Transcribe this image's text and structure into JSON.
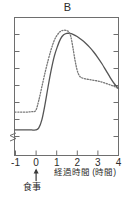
{
  "chart_data": {
    "type": "line",
    "title": "B",
    "xlabel": "経過時間 (時間)",
    "ylabel": "",
    "xlim": [
      -1,
      4
    ],
    "ylim": [
      0,
      1
    ],
    "grid": false,
    "legend": "none",
    "xticks": [
      "-1",
      "0",
      "1",
      "2",
      "3",
      "4"
    ],
    "xtick_values": [
      -1,
      0,
      1,
      2,
      3,
      4
    ],
    "ytick_count": 8,
    "yticks": [],
    "y_axis_break": true,
    "annotations": [
      {
        "name": "meal-marker",
        "text": "食事",
        "x": 0,
        "arrow": "up"
      }
    ],
    "series": [
      {
        "name": "solid-curve",
        "style": "solid",
        "color": "#555555",
        "x": [
          -1.0,
          -0.8,
          -0.6,
          -0.4,
          -0.2,
          0.0,
          0.15,
          0.3,
          0.45,
          0.6,
          0.75,
          0.9,
          1.05,
          1.2,
          1.35,
          1.5,
          1.65,
          1.8,
          2.0,
          2.2,
          2.4,
          2.6,
          2.8,
          3.0,
          3.2,
          3.4,
          3.6,
          3.8,
          4.0
        ],
        "y": [
          0.185,
          0.185,
          0.185,
          0.185,
          0.185,
          0.185,
          0.2,
          0.26,
          0.37,
          0.5,
          0.62,
          0.72,
          0.79,
          0.845,
          0.875,
          0.885,
          0.885,
          0.878,
          0.862,
          0.84,
          0.815,
          0.785,
          0.75,
          0.71,
          0.665,
          0.615,
          0.565,
          0.52,
          0.485
        ]
      },
      {
        "name": "dotted-curve",
        "style": "dotted",
        "color": "#777777",
        "x": [
          -1.0,
          -0.8,
          -0.6,
          -0.4,
          -0.2,
          0.0,
          0.15,
          0.3,
          0.45,
          0.6,
          0.75,
          0.9,
          1.05,
          1.2,
          1.35,
          1.5,
          1.6,
          1.7,
          1.8,
          1.9,
          2.0,
          2.1,
          2.2,
          2.4,
          2.6,
          2.8,
          3.0,
          3.2,
          3.4,
          3.6,
          3.8,
          4.0
        ],
        "y": [
          0.315,
          0.315,
          0.315,
          0.315,
          0.318,
          0.325,
          0.4,
          0.5,
          0.6,
          0.69,
          0.77,
          0.835,
          0.875,
          0.9,
          0.908,
          0.905,
          0.895,
          0.86,
          0.78,
          0.69,
          0.62,
          0.58,
          0.565,
          0.555,
          0.55,
          0.545,
          0.54,
          0.532,
          0.522,
          0.512,
          0.5,
          0.485
        ]
      }
    ]
  },
  "axes": {
    "x_tick_labels": [
      "-1",
      "0",
      "1",
      "2",
      "3",
      "4"
    ],
    "x_axis_title": "経過時間 (時間)"
  },
  "meal": {
    "label": "食事"
  }
}
